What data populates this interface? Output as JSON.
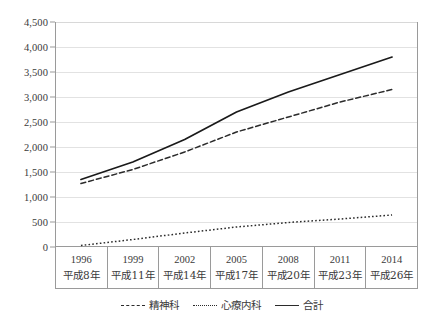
{
  "chart_data": {
    "type": "line",
    "title": "",
    "xlabel": "",
    "ylabel": "",
    "ylim": [
      0,
      4500
    ],
    "ytick_step": 500,
    "grid": true,
    "legend_position": "bottom",
    "categories": [
      "1996",
      "1999",
      "2002",
      "2005",
      "2008",
      "2011",
      "2014"
    ],
    "category_sublabels": [
      "平成8年",
      "平成11年",
      "平成14年",
      "平成17年",
      "平成20年",
      "平成23年",
      "平成26年"
    ],
    "ytick_labels": [
      "0",
      "500",
      "1,000",
      "1,500",
      "2,000",
      "2,500",
      "3,000",
      "3,500",
      "4,000",
      "4,500"
    ],
    "ytick_values": [
      0,
      500,
      1000,
      1500,
      2000,
      2500,
      3000,
      3500,
      4000,
      4500
    ],
    "series": [
      {
        "name": "精神科",
        "style": "dashed",
        "color": "#2b2b2b",
        "values": [
          1270,
          1550,
          1900,
          2300,
          2600,
          2900,
          3150
        ]
      },
      {
        "name": "心療内科",
        "style": "dotted",
        "color": "#2b2b2b",
        "values": [
          30,
          150,
          280,
          400,
          490,
          560,
          640
        ]
      },
      {
        "name": "合計",
        "style": "solid",
        "color": "#1a1a1a",
        "values": [
          1350,
          1700,
          2150,
          2700,
          3100,
          3450,
          3800
        ]
      }
    ]
  },
  "legend": {
    "items": [
      {
        "label": "精神科",
        "style": "dashed"
      },
      {
        "label": "心療内科",
        "style": "dotted"
      },
      {
        "label": "合計",
        "style": "solid"
      }
    ]
  }
}
